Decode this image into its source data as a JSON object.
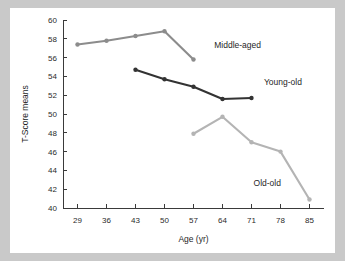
{
  "figure": {
    "background_color": "#c9c9c9",
    "card_color": "#ffffff",
    "axis_color": "#3a3a3a"
  },
  "axis_titles": {
    "x": "Age (yr)",
    "y": "T-Score means"
  },
  "labels": {
    "middle_aged": "Middle-aged",
    "young_old": "Young-old",
    "old_old": "Old-old"
  },
  "chart_data": {
    "type": "line",
    "title": "",
    "xlabel": "Age (yr)",
    "ylabel": "T-Score means",
    "xlim": [
      25.5,
      88.5
    ],
    "ylim": [
      40,
      60
    ],
    "xticks": [
      29,
      36,
      43,
      50,
      57,
      64,
      71,
      78,
      85
    ],
    "xtick_labels": [
      "29",
      "36",
      "43",
      "50",
      "57",
      "64",
      "71",
      "78",
      "85"
    ],
    "yticks": [
      40,
      42,
      44,
      46,
      48,
      50,
      52,
      54,
      56,
      58,
      60
    ],
    "ytick_labels": [
      "40",
      "42",
      "44",
      "46",
      "48",
      "50",
      "52",
      "54",
      "56",
      "58",
      "60"
    ],
    "grid": false,
    "legend_position": "inline-annotations",
    "series": [
      {
        "name": "Middle-aged",
        "color": "#8c8c8c",
        "marker": "circle",
        "x": [
          29,
          36,
          43,
          50,
          57
        ],
        "values": [
          57.4,
          57.8,
          58.3,
          58.8,
          55.8
        ],
        "label_x": 62,
        "label_y": 57.0
      },
      {
        "name": "Young-old",
        "color": "#333333",
        "marker": "circle",
        "x": [
          43,
          50,
          57,
          64,
          71
        ],
        "values": [
          54.7,
          53.7,
          52.9,
          51.6,
          51.7
        ],
        "label_x": 74,
        "label_y": 53.1
      },
      {
        "name": "Old-old",
        "color": "#b4b4b4",
        "marker": "circle",
        "x": [
          57,
          64,
          71,
          78,
          85
        ],
        "values": [
          47.9,
          49.7,
          47.0,
          46.0,
          40.9
        ],
        "label_x": 71.5,
        "label_y": 42.3
      }
    ]
  }
}
